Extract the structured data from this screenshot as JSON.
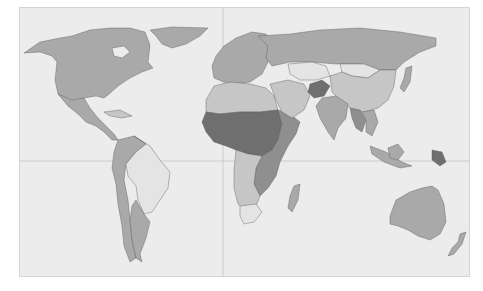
{
  "map": {
    "type": "choropleth world map",
    "projection": "equirectangular",
    "gridlines": {
      "equator": true,
      "prime_meridian": true
    },
    "colors": {
      "ocean": "#ececec",
      "frame": "#d4d4d4",
      "gridline": "#b8b8b8",
      "border": "#555555",
      "level_1_lightest": "#e4e4e4",
      "level_2": "#c6c6c6",
      "level_3": "#a9a9a9",
      "level_4": "#8f8f8f",
      "level_5_darkest": "#6f6f6f"
    },
    "regions": [
      {
        "name": "north-america",
        "shade": "level_3"
      },
      {
        "name": "greenland",
        "shade": "level_3"
      },
      {
        "name": "mexico-central-america",
        "shade": "level_3"
      },
      {
        "name": "caribbean",
        "shade": "level_2"
      },
      {
        "name": "brazil",
        "shade": "level_1_lightest"
      },
      {
        "name": "andes-west-south-america",
        "shade": "level_3"
      },
      {
        "name": "argentina",
        "shade": "level_3"
      },
      {
        "name": "europe",
        "shade": "level_3"
      },
      {
        "name": "russia",
        "shade": "level_3"
      },
      {
        "name": "north-africa",
        "shade": "level_2"
      },
      {
        "name": "sahel-central-africa",
        "shade": "level_5_darkest"
      },
      {
        "name": "east-africa",
        "shade": "level_4"
      },
      {
        "name": "southern-africa",
        "shade": "level_2"
      },
      {
        "name": "south-africa",
        "shade": "level_1_lightest"
      },
      {
        "name": "madagascar",
        "shade": "level_3"
      },
      {
        "name": "middle-east",
        "shade": "level_2"
      },
      {
        "name": "kazakhstan",
        "shade": "level_1_lightest"
      },
      {
        "name": "mongolia",
        "shade": "level_1_lightest"
      },
      {
        "name": "afghanistan",
        "shade": "level_5_darkest"
      },
      {
        "name": "china",
        "shade": "level_2"
      },
      {
        "name": "india",
        "shade": "level_3"
      },
      {
        "name": "southeast-asia",
        "shade": "level_3"
      },
      {
        "name": "myanmar-laos",
        "shade": "level_4"
      },
      {
        "name": "indonesia",
        "shade": "level_3"
      },
      {
        "name": "papua-new-guinea",
        "shade": "level_5_darkest"
      },
      {
        "name": "japan",
        "shade": "level_3"
      },
      {
        "name": "australia",
        "shade": "level_3"
      },
      {
        "name": "new-zealand",
        "shade": "level_3"
      }
    ]
  }
}
